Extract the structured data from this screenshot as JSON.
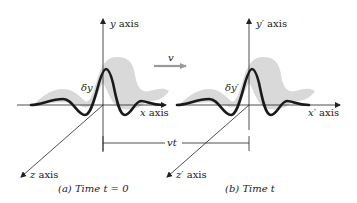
{
  "panels": [
    {
      "id": "a",
      "caption": "(a) Time t = 0",
      "y_axis_label": "y axis",
      "x_axis_label": "x axis",
      "z_axis_label": "z axis",
      "displacement_label": "δy"
    },
    {
      "id": "b",
      "caption": "(b) Time t",
      "y_axis_label": "y′ axis",
      "x_axis_label": "x′ axis",
      "z_axis_label": "z′ axis",
      "displacement_label": "δy′"
    }
  ],
  "velocity_label": "v",
  "displacement_bracket_label": "vt",
  "colors": {
    "wave": "#1a1a1a",
    "shadow": "#d9d9d9",
    "axis": "#222222",
    "velocity_arrow": "#999999"
  }
}
